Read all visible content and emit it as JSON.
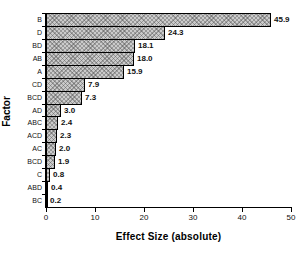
{
  "chart_data": {
    "type": "bar",
    "orientation": "horizontal",
    "title": "",
    "xlabel": "Effect Size (absolute)",
    "ylabel": "Factor",
    "xlim": [
      0,
      50
    ],
    "xticks": [
      0,
      10,
      20,
      30,
      40,
      50
    ],
    "grid": false,
    "legend": false,
    "categories": [
      "B",
      "D",
      "BD",
      "AB",
      "A",
      "CD",
      "BCD",
      "AD",
      "ABC",
      "ACD",
      "AC",
      "BCD",
      "C",
      "ABD",
      "BC"
    ],
    "values": [
      45.9,
      24.3,
      18.1,
      18.0,
      15.9,
      7.9,
      7.3,
      3.0,
      2.4,
      2.3,
      2.0,
      1.9,
      0.8,
      0.4,
      0.2
    ],
    "value_labels": [
      "45.9",
      "24.3",
      "18.1",
      "18.0",
      "15.9",
      "7.9",
      "7.3",
      "3.0",
      "2.4",
      "2.3",
      "2.0",
      "1.9",
      "0.8",
      "0.4",
      "0.2"
    ],
    "bar_fill_color": "#cbcbcb",
    "bar_border_color": "#000000",
    "bar_pattern": "crosshatch"
  }
}
